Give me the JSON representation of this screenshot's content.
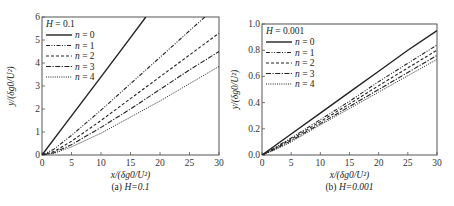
{
  "chart_data": [
    {
      "type": "line",
      "panel": "a",
      "caption": "(a)  H=0.1",
      "caption_prefix": "(a)",
      "caption_param": "H=0.1",
      "legend_title": "H = 0.1",
      "xlabel": "x/(δg0/U²)",
      "ylabel": "y/(δg0/U²)",
      "xlim": [
        0,
        30
      ],
      "ylim": [
        0,
        6
      ],
      "xticks": [
        0,
        5,
        10,
        15,
        20,
        25,
        30
      ],
      "yticks": [
        0,
        1,
        2,
        3,
        4,
        5,
        6
      ],
      "grid": false,
      "legend_position": "upper left",
      "series": [
        {
          "name": "n = 0",
          "style": "solid",
          "x": [
            0,
            5,
            10,
            15,
            17.6
          ],
          "y": [
            0,
            1.7,
            3.4,
            5.1,
            6.0
          ]
        },
        {
          "name": "n = 1",
          "style": "dash-dot-dot",
          "x": [
            0,
            2,
            5,
            10,
            15,
            20,
            25,
            27.6
          ],
          "y": [
            0,
            0.25,
            0.85,
            1.95,
            3.1,
            4.25,
            5.4,
            6.0
          ]
        },
        {
          "name": "n = 2",
          "style": "dashed",
          "x": [
            0,
            2,
            5,
            10,
            15,
            20,
            25,
            30
          ],
          "y": [
            0,
            0.15,
            0.6,
            1.5,
            2.45,
            3.4,
            4.35,
            5.3
          ]
        },
        {
          "name": "n = 3",
          "style": "dash-dot",
          "x": [
            0,
            2,
            5,
            10,
            15,
            20,
            25,
            30
          ],
          "y": [
            0,
            0.1,
            0.45,
            1.2,
            2.0,
            2.85,
            3.7,
            4.5
          ]
        },
        {
          "name": "n = 4",
          "style": "dotted",
          "x": [
            0,
            2,
            5,
            10,
            15,
            20,
            25,
            30
          ],
          "y": [
            0,
            0.07,
            0.35,
            0.95,
            1.65,
            2.35,
            3.1,
            3.85
          ]
        }
      ]
    },
    {
      "type": "line",
      "panel": "b",
      "caption": "(b)  H=0.001",
      "caption_prefix": "(b)",
      "caption_param": "H=0.001",
      "legend_title": "H = 0.001",
      "xlabel": "x/(δg0/U²)",
      "ylabel": "y/(δg0/U²)",
      "xlim": [
        0,
        30
      ],
      "ylim": [
        0,
        1.0
      ],
      "xticks": [
        0,
        5,
        10,
        15,
        20,
        25,
        30
      ],
      "yticks": [
        0.0,
        0.2,
        0.4,
        0.6,
        0.8,
        1.0
      ],
      "grid": false,
      "legend_position": "upper left",
      "series": [
        {
          "name": "n = 0",
          "style": "solid",
          "x": [
            0,
            5,
            10,
            15,
            20,
            25,
            30
          ],
          "y": [
            0,
            0.16,
            0.32,
            0.48,
            0.64,
            0.8,
            0.95
          ]
        },
        {
          "name": "n = 1",
          "style": "dash-dot-dot",
          "x": [
            0,
            2,
            5,
            10,
            15,
            20,
            25,
            30
          ],
          "y": [
            0,
            0.05,
            0.13,
            0.27,
            0.41,
            0.56,
            0.7,
            0.84
          ]
        },
        {
          "name": "n = 2",
          "style": "dashed",
          "x": [
            0,
            2,
            5,
            10,
            15,
            20,
            25,
            30
          ],
          "y": [
            0,
            0.045,
            0.12,
            0.255,
            0.39,
            0.53,
            0.665,
            0.8
          ]
        },
        {
          "name": "n = 3",
          "style": "dash-dot",
          "x": [
            0,
            2,
            5,
            10,
            15,
            20,
            25,
            30
          ],
          "y": [
            0,
            0.04,
            0.11,
            0.24,
            0.37,
            0.5,
            0.63,
            0.76
          ]
        },
        {
          "name": "n = 4",
          "style": "dotted",
          "x": [
            0,
            2,
            5,
            10,
            15,
            20,
            25,
            30
          ],
          "y": [
            0,
            0.035,
            0.1,
            0.23,
            0.355,
            0.48,
            0.605,
            0.73
          ]
        }
      ]
    }
  ],
  "colors": {
    "line": "#222222",
    "axis": "#555555",
    "background": "#ffffff"
  }
}
